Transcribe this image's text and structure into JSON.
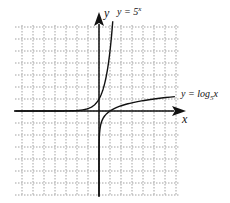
{
  "chart_data": {
    "type": "line",
    "title": "",
    "xlabel": "x",
    "ylabel": "y",
    "grid": true,
    "grid_style": "dotted",
    "xlim": [
      -7.5,
      7.5
    ],
    "ylim": [
      -7,
      7.5
    ],
    "series": [
      {
        "name": "y = 5^x",
        "function": "5^x",
        "x": [
          -7,
          -3,
          -2,
          -1,
          -0.5,
          0,
          0.5,
          1,
          1.4
        ],
        "y": [
          0,
          0.008,
          0.04,
          0.2,
          0.45,
          1,
          2.24,
          5,
          9.5
        ]
      },
      {
        "name": "y = log_5 x",
        "function": "log5(x)",
        "x": [
          0.01,
          0.04,
          0.2,
          0.5,
          1,
          2,
          5,
          7
        ],
        "y": [
          -2.86,
          -2,
          -1,
          -0.43,
          0,
          0.43,
          1,
          1.21
        ]
      }
    ]
  },
  "labels": {
    "y_axis": "y",
    "x_axis": "x",
    "exp_base": "y = 5",
    "exp_power": "x",
    "log_prefix": "y = log",
    "log_base": "5",
    "log_arg": "x"
  },
  "colors": {
    "curve": "#111111",
    "grid": "#8a8a8a",
    "axis": "#111111"
  }
}
